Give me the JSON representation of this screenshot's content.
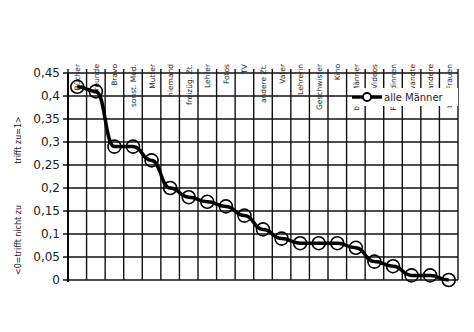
{
  "chart_data": {
    "type": "line",
    "title": "",
    "xlabel": "",
    "ylabel_top": "trifft zu=1>",
    "ylabel_bottom": "<0=trifft nicht zu",
    "ylim": [
      0,
      0.45
    ],
    "yticks": [
      0,
      0.05,
      0.1,
      0.15,
      0.2,
      0.25,
      0.3,
      0.35,
      0.4,
      0.45
    ],
    "ytick_labels": [
      "0",
      "0,05",
      "0,1",
      "0,15",
      "0,2",
      "0,25",
      "0,3",
      "0,35",
      "0,4",
      "0,45"
    ],
    "grid": true,
    "legend_position": "upper right",
    "categories": [
      "Bücher",
      "Freunde",
      "Bravo",
      "sonst. Med.",
      "Mutter",
      "niemand",
      "freizüg. Zt.",
      "Lehrer",
      "Fotos",
      "TV",
      "andere Zt.",
      "Vater",
      "Lehrerin",
      "Geschwister",
      "Kino",
      "bek. Männer",
      "Videos",
      "Freundinnen",
      "Verwandte",
      "andere",
      "bek. Frauen"
    ],
    "series": [
      {
        "name": "alle Männer",
        "values": [
          0.42,
          0.41,
          0.29,
          0.29,
          0.26,
          0.2,
          0.18,
          0.17,
          0.16,
          0.14,
          0.11,
          0.09,
          0.08,
          0.08,
          0.08,
          0.07,
          0.04,
          0.03,
          0.01,
          0.01,
          0.0
        ]
      }
    ]
  }
}
